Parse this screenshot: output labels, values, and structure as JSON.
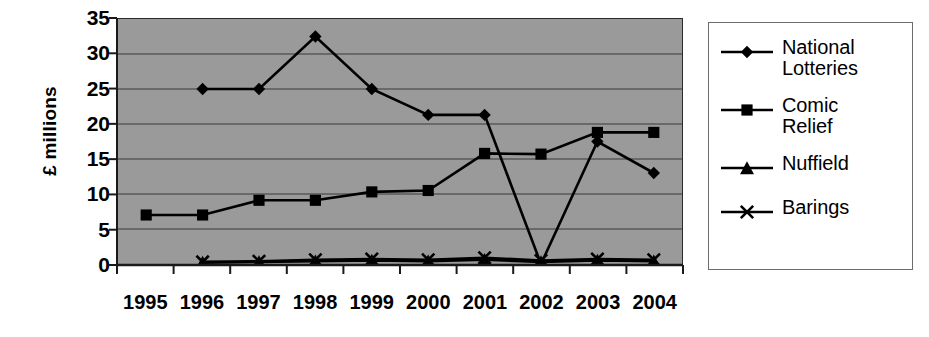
{
  "chart_data": {
    "type": "line",
    "title": "",
    "xlabel": "",
    "ylabel": "£ millions",
    "categories": [
      "1995",
      "1996",
      "1997",
      "1998",
      "1999",
      "2000",
      "2001",
      "2002",
      "2003",
      "2004"
    ],
    "ylim": [
      0,
      35
    ],
    "ytick_step": 5,
    "yticks": [
      35,
      30,
      25,
      20,
      15,
      10,
      5,
      0
    ],
    "grid": "horizontal",
    "legend_position": "right-outside",
    "plot_background": "#9a9a9a",
    "series": [
      {
        "name": "National Lotteries",
        "legend_label": "National\nLotteries",
        "marker": "diamond",
        "color": "#000000",
        "values": [
          null,
          25,
          25,
          32.5,
          25,
          21.3,
          21.3,
          0,
          17.5,
          13
        ]
      },
      {
        "name": "Comic Relief",
        "legend_label": "Comic\nRelief",
        "marker": "square",
        "color": "#000000",
        "values": [
          7,
          7,
          9.1,
          9.1,
          10.3,
          10.5,
          15.8,
          15.7,
          18.8,
          18.8
        ]
      },
      {
        "name": "Nuffield",
        "legend_label": "Nuffield",
        "marker": "triangle",
        "color": "#000000",
        "values": [
          null,
          0.2,
          0.3,
          0.4,
          0.5,
          0.4,
          0.6,
          0.3,
          0.5,
          0.4
        ]
      },
      {
        "name": "Barings",
        "legend_label": "Barings",
        "marker": "x",
        "color": "#000000",
        "values": [
          null,
          0.3,
          0.4,
          0.6,
          0.7,
          0.6,
          0.9,
          0.5,
          0.7,
          0.6
        ]
      }
    ]
  },
  "axis": {
    "y_title": "£ millions",
    "y_tick_labels": [
      "35",
      "30",
      "25",
      "20",
      "15",
      "10",
      "5",
      "0"
    ],
    "x_tick_labels": [
      "1995",
      "1996",
      "1997",
      "1998",
      "1999",
      "2000",
      "2001",
      "2002",
      "2003",
      "2004"
    ]
  },
  "legend": {
    "items": [
      {
        "label": "National\nLotteries",
        "marker": "diamond-marker"
      },
      {
        "label": "Comic\nRelief",
        "marker": "square-marker"
      },
      {
        "label": "Nuffield",
        "marker": "triangle-marker"
      },
      {
        "label": "Barings",
        "marker": "x-marker"
      }
    ]
  }
}
